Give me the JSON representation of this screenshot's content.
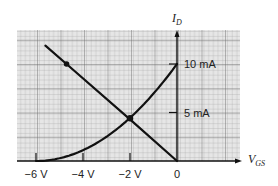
{
  "chart_data": {
    "type": "line",
    "title": "",
    "xlabel": "V_GS",
    "ylabel": "I_D",
    "x_label_main": "V",
    "x_label_sub": "GS",
    "y_label_main": "I",
    "y_label_sub": "D",
    "xlim": [
      -6.8,
      2.7
    ],
    "ylim": [
      0,
      13.5
    ],
    "grid": true,
    "x_ticks": [
      {
        "value": -6,
        "label": "−6 V"
      },
      {
        "value": -4,
        "label": "−4 V"
      },
      {
        "value": -2,
        "label": "−2 V"
      },
      {
        "value": 0,
        "label": "0"
      }
    ],
    "y_ticks": [
      {
        "value": 5,
        "label": "5 mA"
      },
      {
        "value": 10,
        "label": "10 mA"
      }
    ],
    "series": [
      {
        "name": "transfer-curve",
        "description": "JFET transconductance curve I_D = I_DSS(1 - V_GS/V_GS(off))^2",
        "I_DSS_mA": 10,
        "V_GS_off": -6,
        "x": [
          -6,
          -5.5,
          -5,
          -4.5,
          -4,
          -3.5,
          -3,
          -2.5,
          -2,
          -1.5,
          -1,
          -0.5,
          0
        ],
        "values": [
          0,
          0.07,
          0.28,
          0.63,
          1.11,
          1.74,
          2.5,
          3.4,
          4.44,
          5.63,
          6.94,
          8.4,
          10
        ]
      },
      {
        "name": "bias-line",
        "description": "Self-bias line through origin",
        "x": [
          -5.6,
          -4.7,
          -2,
          0
        ],
        "values": [
          11.9,
          10,
          4.3,
          0
        ]
      }
    ],
    "points": [
      {
        "name": "bias-line-marker",
        "x": -4.7,
        "y": 10
      },
      {
        "name": "Q-point",
        "x": -2,
        "y": 4.4
      }
    ]
  }
}
